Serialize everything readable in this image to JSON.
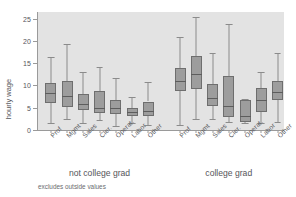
{
  "chart_data": {
    "type": "box",
    "title": "",
    "xlabel": "",
    "ylabel": "hourly wage",
    "ylim": [
      0,
      26.5
    ],
    "yticks": [
      0,
      5,
      10,
      15,
      20,
      25
    ],
    "grid": false,
    "legend": "none",
    "note": "excludes outside values",
    "categories": [
      "Prof",
      "Mgmt",
      "Sales",
      "Cler.",
      "Operat.",
      "Labor",
      "Other"
    ],
    "groups": [
      {
        "name": "not college grad",
        "boxes": [
          {
            "category": "Prof",
            "lower_whisker": 1.5,
            "q1": 6.0,
            "median": 8.4,
            "q3": 10.5,
            "upper_whisker": 16.4
          },
          {
            "category": "Mgmt",
            "lower_whisker": 2.4,
            "q1": 5.2,
            "median": 7.7,
            "q3": 11.0,
            "upper_whisker": 19.3
          },
          {
            "category": "Sales",
            "lower_whisker": 1.6,
            "q1": 4.6,
            "median": 5.8,
            "q3": 8.0,
            "upper_whisker": 13.0
          },
          {
            "category": "Cler.",
            "lower_whisker": 2.2,
            "q1": 3.9,
            "median": 5.0,
            "q3": 8.8,
            "upper_whisker": 14.2
          },
          {
            "category": "Operat.",
            "lower_whisker": 1.0,
            "q1": 3.5,
            "median": 5.0,
            "q3": 6.8,
            "upper_whisker": 11.6
          },
          {
            "category": "Labor",
            "lower_whisker": 1.5,
            "q1": 3.2,
            "median": 4.0,
            "q3": 5.0,
            "upper_whisker": 7.4
          },
          {
            "category": "Other",
            "lower_whisker": 1.1,
            "q1": 3.1,
            "median": 4.2,
            "q3": 6.4,
            "upper_whisker": 10.7
          }
        ]
      },
      {
        "name": "college grad",
        "boxes": [
          {
            "category": "Prof",
            "lower_whisker": 1.1,
            "q1": 8.8,
            "median": 10.9,
            "q3": 13.9,
            "upper_whisker": 20.9
          },
          {
            "category": "Mgmt",
            "lower_whisker": 2.4,
            "q1": 9.3,
            "median": 12.6,
            "q3": 16.7,
            "upper_whisker": 25.3
          },
          {
            "category": "Sales",
            "lower_whisker": 2.4,
            "q1": 5.4,
            "median": 7.1,
            "q3": 10.4,
            "upper_whisker": 17.3
          },
          {
            "category": "Cler.",
            "lower_whisker": 1.7,
            "q1": 2.9,
            "median": 5.4,
            "q3": 12.2,
            "upper_whisker": 23.8
          },
          {
            "category": "Operat.",
            "lower_whisker": 1.5,
            "q1": 1.8,
            "median": 3.1,
            "q3": 6.7,
            "upper_whisker": 6.9
          },
          {
            "category": "Labor",
            "lower_whisker": 1.5,
            "q1": 4.0,
            "median": 6.8,
            "q3": 9.5,
            "upper_whisker": 13.1
          },
          {
            "category": "Other",
            "lower_whisker": 1.7,
            "q1": 6.7,
            "median": 8.5,
            "q3": 10.9,
            "upper_whisker": 17.2
          }
        ]
      }
    ],
    "colors": {
      "plot_background": "#e3e3e3",
      "box_fill": "#9d9d9d",
      "box_border": "#6e6e6e",
      "median_line": "#5d5d5d",
      "whisker": "#8b8b8b",
      "axis": "#9a9a9a",
      "text": "#55565a",
      "figure_background": "#ffffff"
    }
  }
}
